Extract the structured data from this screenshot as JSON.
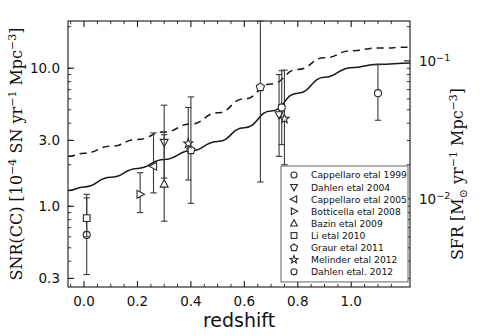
{
  "chart_data": {
    "type": "scatter",
    "title": "",
    "xlabel": "redshift",
    "ylabel_left": "SNR(CC)  [10^-4 SN yr^-1 Mpc^-3]",
    "ylabel_right": "SFR  [M_sun yr^-1 Mpc^-3]",
    "xlim": [
      -0.06,
      1.22
    ],
    "ylim_left": [
      0.26,
      22.0
    ],
    "ylim_right": [
      0.0041,
      0.35
    ],
    "yscale": "log",
    "grid": false,
    "legend_position": "lower right",
    "xticks": [
      0.0,
      0.2,
      0.4,
      0.6,
      0.8,
      1.0
    ],
    "xticklabels": [
      "0.0",
      "0.2",
      "0.4",
      "0.6",
      "0.8",
      "1.0"
    ],
    "yticks_left": [
      0.3,
      1.0,
      3.0,
      10.0
    ],
    "yticklabels_left": [
      "0.3",
      "1.0",
      "3.0",
      "10.0"
    ],
    "yticks_right": [
      0.01,
      0.1
    ],
    "yticklabels_right": [
      "10^-2",
      "10^-1"
    ],
    "series": [
      {
        "name": "Cappellaro etal 1999",
        "marker": "circle",
        "points": [
          {
            "x": 0.01,
            "y": 0.62,
            "yerr_lo": 0.32,
            "yerr_hi": 1.15
          }
        ]
      },
      {
        "name": "Dahlen etal 2004",
        "marker": "triangle-down",
        "points": [
          {
            "x": 0.3,
            "y": 2.9,
            "yerr_lo": 1.6,
            "yerr_hi": 5.4
          },
          {
            "x": 0.73,
            "y": 4.6,
            "yerr_lo": 2.3,
            "yerr_hi": 9.0
          }
        ]
      },
      {
        "name": "Cappellaro etal 2005",
        "marker": "triangle-left",
        "points": [
          {
            "x": 0.26,
            "y": 1.95,
            "yerr_lo": 1.25,
            "yerr_hi": 3.4
          }
        ]
      },
      {
        "name": "Botticella etal 2008",
        "marker": "triangle-right",
        "points": [
          {
            "x": 0.21,
            "y": 1.22,
            "yerr_lo": 0.9,
            "yerr_hi": 1.75
          }
        ]
      },
      {
        "name": "Bazin etal 2009",
        "marker": "triangle-up",
        "points": [
          {
            "x": 0.3,
            "y": 1.45,
            "yerr_lo": 0.78,
            "yerr_hi": 3.3
          }
        ]
      },
      {
        "name": "Li etal 2010",
        "marker": "square",
        "points": [
          {
            "x": 0.01,
            "y": 0.82,
            "yerr_lo": 0.6,
            "yerr_hi": 1.22
          }
        ]
      },
      {
        "name": "Graur etal 2011",
        "marker": "pentagon",
        "points": [
          {
            "x": 0.4,
            "y": 2.55,
            "yerr_lo": 1.05,
            "yerr_hi": 6.2
          },
          {
            "x": 0.66,
            "y": 7.3,
            "yerr_lo": 1.5,
            "yerr_hi": 22.0
          }
        ]
      },
      {
        "name": "Melinder etal 2012",
        "marker": "star",
        "points": [
          {
            "x": 0.39,
            "y": 2.85,
            "yerr_lo": 1.55,
            "yerr_hi": 5.2
          },
          {
            "x": 0.75,
            "y": 4.3,
            "yerr_lo": 2.0,
            "yerr_hi": 9.7
          }
        ]
      },
      {
        "name": "Dahlen etal. 2012",
        "marker": "circle",
        "points": [
          {
            "x": 0.74,
            "y": 5.2,
            "yerr_lo": 2.8,
            "yerr_hi": 9.6
          },
          {
            "x": 1.1,
            "y": 6.6,
            "yerr_lo": 4.2,
            "yerr_hi": 10.6
          }
        ]
      }
    ],
    "curves": [
      {
        "name": "model-dashed",
        "style": "dashed",
        "points": [
          [
            -0.06,
            2.3
          ],
          [
            0.0,
            2.42
          ],
          [
            0.1,
            2.72
          ],
          [
            0.2,
            3.05
          ],
          [
            0.3,
            3.45
          ],
          [
            0.4,
            3.95
          ],
          [
            0.5,
            4.75
          ],
          [
            0.6,
            6.0
          ],
          [
            0.7,
            7.7
          ],
          [
            0.8,
            9.8
          ],
          [
            0.9,
            11.9
          ],
          [
            1.0,
            13.4
          ],
          [
            1.1,
            14.0
          ],
          [
            1.22,
            14.2
          ]
        ]
      },
      {
        "name": "model-solid",
        "style": "solid",
        "points": [
          [
            -0.06,
            1.3
          ],
          [
            0.0,
            1.38
          ],
          [
            0.1,
            1.62
          ],
          [
            0.2,
            1.88
          ],
          [
            0.3,
            2.18
          ],
          [
            0.4,
            2.52
          ],
          [
            0.5,
            2.95
          ],
          [
            0.6,
            3.7
          ],
          [
            0.7,
            4.9
          ],
          [
            0.8,
            6.6
          ],
          [
            0.9,
            8.6
          ],
          [
            1.0,
            10.1
          ],
          [
            1.1,
            10.7
          ],
          [
            1.22,
            10.9
          ]
        ]
      }
    ]
  },
  "legend": {
    "entries": [
      {
        "marker": "circle",
        "label": "Cappellaro etal 1999"
      },
      {
        "marker": "triangle-down",
        "label": "Dahlen etal 2004"
      },
      {
        "marker": "triangle-left",
        "label": "Cappellaro etal 2005"
      },
      {
        "marker": "triangle-right",
        "label": "Botticella etal 2008"
      },
      {
        "marker": "triangle-up",
        "label": "Bazin etal 2009"
      },
      {
        "marker": "square",
        "label": "Li etal 2010"
      },
      {
        "marker": "pentagon",
        "label": "Graur etal 2011"
      },
      {
        "marker": "star",
        "label": "Melinder etal 2012"
      },
      {
        "marker": "circle",
        "label": "Dahlen etal. 2012"
      }
    ]
  },
  "axes": {
    "xlabel": "redshift",
    "xticklabels": [
      "0.0",
      "0.2",
      "0.4",
      "0.6",
      "0.8",
      "1.0"
    ],
    "yticklabels_left": [
      "10.0",
      "3.0",
      "1.0",
      "0.3"
    ],
    "ylabel_left_parts": {
      "p1": "SNR(CC)  [10",
      "sup1": "−4",
      "p2": " SN yr",
      "sup2": "−1",
      "p3": " Mpc",
      "sup3": "−3",
      "p4": "]"
    },
    "ylabel_right_parts": {
      "p1": "SFR  [M",
      "sub1": "⊙",
      "p2": " yr",
      "sup1": "−1",
      "p3": " Mpc",
      "sup2": "−3",
      "p4": "]"
    },
    "yticklabels_right": [
      {
        "base": "10",
        "exp": "−1"
      },
      {
        "base": "10",
        "exp": "−2"
      }
    ]
  },
  "colors": {
    "axis": "#1a1a1a",
    "marker_edge": "#2a2a2a",
    "marker_face": "#ffffff",
    "errorbar": "#3a3a3a",
    "background": "#ffffff"
  }
}
